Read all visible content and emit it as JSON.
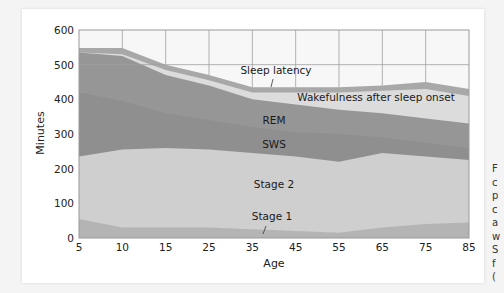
{
  "chart_data": {
    "type": "area",
    "stacked": true,
    "title": "",
    "xlabel": "Age",
    "ylabel": "Minutes",
    "ylim": [
      0,
      600
    ],
    "xlim": [
      5,
      85
    ],
    "x": [
      5,
      10,
      15,
      25,
      35,
      45,
      55,
      65,
      75,
      85
    ],
    "x_ticks": [
      "5",
      "10",
      "15",
      "25",
      "35",
      "45",
      "55",
      "65",
      "75",
      "85"
    ],
    "y_ticks": [
      "0",
      "100",
      "200",
      "300",
      "400",
      "500",
      "600"
    ],
    "grid": true,
    "series": [
      {
        "name": "Stage 1",
        "color": "#b4b4b4",
        "cumulative_top": [
          55,
          30,
          30,
          30,
          25,
          20,
          15,
          30,
          40,
          45
        ]
      },
      {
        "name": "Stage 2",
        "color": "#cfcfcf",
        "cumulative_top": [
          235,
          255,
          260,
          255,
          245,
          235,
          220,
          245,
          235,
          225
        ]
      },
      {
        "name": "SWS",
        "color": "#8f8f8f",
        "cumulative_top": [
          420,
          395,
          360,
          340,
          320,
          305,
          300,
          290,
          275,
          260
        ]
      },
      {
        "name": "REM",
        "color": "#969696",
        "cumulative_top": [
          535,
          525,
          470,
          440,
          400,
          385,
          370,
          360,
          345,
          330
        ]
      },
      {
        "name": "Wakefulness after sleep onset",
        "color": "#dcdcdc",
        "cumulative_top": [
          535,
          530,
          485,
          455,
          420,
          420,
          420,
          425,
          430,
          410
        ]
      },
      {
        "name": "Sleep latency",
        "color": "#a8a8a8",
        "cumulative_top": [
          548,
          548,
          500,
          470,
          435,
          435,
          435,
          440,
          450,
          430
        ]
      }
    ],
    "annotations": [
      {
        "text": "Sleep latency",
        "x": 40,
        "y": 470
      },
      {
        "text": "Wakefulness after sleep onset",
        "x": 62,
        "y": 420
      },
      {
        "text": "REM",
        "x": 40,
        "y": 375
      },
      {
        "text": "SWS",
        "x": 40,
        "y": 305
      },
      {
        "text": "Stage 2",
        "x": 40,
        "y": 150
      },
      {
        "text": "Stage 1",
        "x": 40,
        "y": 50
      }
    ]
  },
  "labels": {
    "ylabel": "Minutes",
    "xlabel": "Age",
    "sleep_latency": "Sleep latency",
    "waso": "Wakefulness after sleep onset",
    "rem": "REM",
    "sws": "SWS",
    "stage2": "Stage 2",
    "stage1": "Stage 1"
  },
  "side_caption": {
    "text": "F\nc\np\nc\na\nw\nS\nf\n("
  }
}
